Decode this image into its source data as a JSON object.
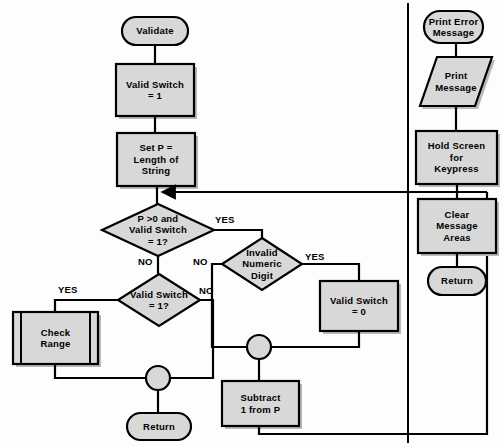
{
  "diagram": {
    "type": "flowchart",
    "style": {
      "fill": "#d8d8d8",
      "stroke": "#000000",
      "background": "#fdfdfd",
      "text_color": "#000000"
    },
    "left_flow": {
      "name": "Validate",
      "nodes": [
        {
          "id": "validate",
          "label": "Validate",
          "shape": "terminator",
          "x": 122,
          "y": 17,
          "w": 66,
          "h": 28
        },
        {
          "id": "valid_switch_1",
          "label": "Valid Switch\n= 1",
          "shape": "process",
          "x": 116,
          "y": 64,
          "w": 78,
          "h": 52
        },
        {
          "id": "set_p",
          "label": "Set P =\nLength of\nString",
          "shape": "process",
          "x": 117,
          "y": 133,
          "w": 78,
          "h": 53
        },
        {
          "id": "dec_p_gt_0",
          "label": "P >0 and\nValid Switch\n= 1?",
          "shape": "decision",
          "x": 102,
          "y": 204,
          "w": 112,
          "h": 52
        },
        {
          "id": "dec_invalid",
          "label": "Invalid\nNumeric\nDigit",
          "shape": "decision",
          "x": 222,
          "y": 238,
          "w": 80,
          "h": 52
        },
        {
          "id": "valid_switch_0",
          "label": "Valid Switch\n= 0",
          "shape": "process",
          "x": 320,
          "y": 281,
          "w": 78,
          "h": 50
        },
        {
          "id": "dec_vs_1",
          "label": "Valid Switch\n= 1?",
          "shape": "decision",
          "x": 118,
          "y": 274,
          "w": 82,
          "h": 52
        },
        {
          "id": "check_range",
          "label": "Check\nRange",
          "shape": "predefined-process",
          "x": 13,
          "y": 312,
          "w": 85,
          "h": 52
        },
        {
          "id": "subtract_p",
          "label": "Subtract\n1 from P",
          "shape": "process",
          "x": 222,
          "y": 381,
          "w": 77,
          "h": 45
        },
        {
          "id": "connector_a",
          "label": "",
          "shape": "connector",
          "x": 247,
          "y": 335,
          "w": 24,
          "h": 24
        },
        {
          "id": "connector_b",
          "label": "",
          "shape": "connector",
          "x": 146,
          "y": 366,
          "w": 24,
          "h": 24
        },
        {
          "id": "return_left",
          "label": "Return",
          "shape": "terminator",
          "x": 127,
          "y": 413,
          "w": 64,
          "h": 27
        }
      ],
      "edge_labels": [
        {
          "id": "yes_p_gt_0",
          "text": "YES",
          "x": 215,
          "y": 214
        },
        {
          "id": "no_p_gt_0",
          "text": "NO",
          "x": 138,
          "y": 256
        },
        {
          "id": "no_invalid",
          "text": "NO",
          "x": 195,
          "y": 256
        },
        {
          "id": "yes_invalid",
          "text": "YES",
          "x": 305,
          "y": 251
        },
        {
          "id": "yes_vs_1",
          "text": "YES",
          "x": 58,
          "y": 283
        },
        {
          "id": "no_vs_1",
          "text": "NO",
          "x": 199,
          "y": 284
        }
      ]
    },
    "right_flow": {
      "name": "Print Error Message",
      "nodes": [
        {
          "id": "print_error_msg",
          "label": "Print Error\nMessage",
          "shape": "terminator",
          "x": 424,
          "y": 11,
          "w": 59,
          "h": 32
        },
        {
          "id": "print_message",
          "label": "Print\nMessage",
          "shape": "io",
          "x": 424,
          "y": 57,
          "w": 68,
          "h": 49
        },
        {
          "id": "hold_screen",
          "label": "Hold Screen\nfor\nKeypress",
          "shape": "process",
          "x": 416,
          "y": 131,
          "w": 81,
          "h": 53
        },
        {
          "id": "clear_message",
          "label": "Clear\nMessage\nAreas",
          "shape": "process",
          "x": 418,
          "y": 199,
          "w": 78,
          "h": 54
        },
        {
          "id": "return_right",
          "label": "Return",
          "shape": "terminator",
          "x": 428,
          "y": 267,
          "w": 58,
          "h": 28
        }
      ],
      "edge_labels": []
    }
  }
}
